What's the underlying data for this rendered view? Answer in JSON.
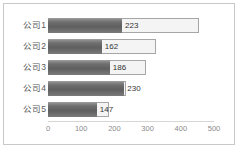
{
  "chart_data": {
    "type": "bar",
    "orientation": "horizontal",
    "title": "",
    "xlabel": "",
    "ylabel": "",
    "categories": [
      "公司1",
      "公司2",
      "公司3",
      "公司4",
      "公司5"
    ],
    "values": [
      223,
      162,
      186,
      230,
      147
    ],
    "value_labels": [
      "223",
      "162",
      "186",
      "230",
      "147"
    ],
    "xticks": [
      "0",
      "100",
      "200",
      "300",
      "400",
      "500"
    ],
    "xtick_values": [
      0,
      100,
      200,
      300,
      400,
      500
    ],
    "xlim": [
      0,
      500
    ],
    "grid": false,
    "legend": false,
    "bar_color": "#6e6e6e",
    "label_box_color": "#f4f4f4",
    "label_box_border": "#a6a6a6",
    "axis_text_color": "#8a8a8a",
    "category_text_color": "#595959",
    "frame_border_color": "#c9c9c9",
    "label_box_widths": [
      455,
      325,
      295,
      232,
      185
    ]
  }
}
